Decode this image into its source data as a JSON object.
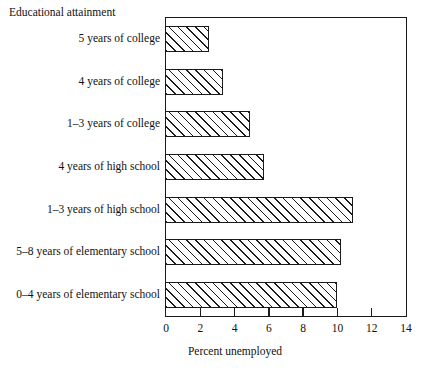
{
  "chart_data": {
    "type": "bar",
    "orientation": "horizontal",
    "title": "",
    "xlabel": "Percent unemployed",
    "ylabel": "Educational attainment",
    "categories": [
      "5 years of college",
      "4 years of college",
      "1–3 years of college",
      "4 years of high school",
      "1–3 years of high school",
      "5–8 years of elementary school",
      "0–4 years of elementary school"
    ],
    "values": [
      2.5,
      3.3,
      4.9,
      5.7,
      10.9,
      10.2,
      10.0
    ],
    "xlim": [
      0,
      14
    ],
    "xticks": [
      0,
      2,
      4,
      6,
      8,
      10,
      12,
      14
    ],
    "xtick_labels": [
      "0",
      "2",
      "4",
      "6",
      "8",
      "10",
      "12",
      "14"
    ],
    "grid": false,
    "legend": false,
    "bar_fill": "#ffffff",
    "bar_hatch": "forward-diagonal",
    "bar_edge_color": "#1a1a1a",
    "frame_color": "#1a1a1a",
    "background": "#ffffff"
  }
}
